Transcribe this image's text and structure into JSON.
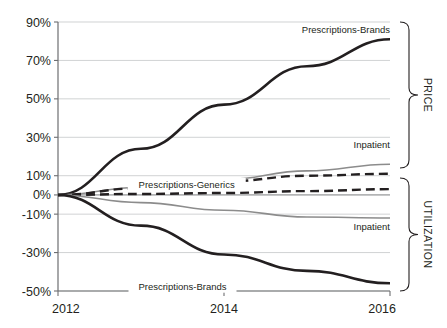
{
  "chart_data": {
    "type": "line",
    "title": "",
    "xlabel": "",
    "ylabel": "",
    "xlim": [
      2012,
      2016
    ],
    "ylim": [
      -50,
      90
    ],
    "grid": true,
    "legend_position": "inline-end-labels",
    "x": [
      2012,
      2013,
      2014,
      2015,
      2016
    ],
    "xticks": [
      "2012",
      "2014",
      "2016"
    ],
    "yticks": [
      "90%",
      "70%",
      "50%",
      "30%",
      "10%",
      "0%",
      "-10%",
      "-30%",
      "-50%"
    ],
    "ytick_values": [
      90,
      70,
      50,
      30,
      10,
      0,
      -10,
      -30,
      -50
    ],
    "groups": [
      {
        "name": "PRICE",
        "range": [
          10,
          90
        ]
      },
      {
        "name": "UTILIZATION",
        "range": [
          -50,
          0
        ]
      }
    ],
    "series": [
      {
        "name": "Prescriptions-Brands",
        "group": "PRICE",
        "style": "solid",
        "color": "#231f20",
        "width": 2.6,
        "label": "Prescriptions-Brands",
        "label_x": 2015.05,
        "label_y": 86,
        "values": [
          0,
          24,
          47,
          67,
          81
        ]
      },
      {
        "name": "Inpatient",
        "group": "PRICE",
        "style": "solid",
        "color": "#8c8c8c",
        "width": 1.6,
        "label": "Inpatient",
        "label_x": 2015.25,
        "label_y": 26,
        "values": [
          0,
          4,
          8,
          12.5,
          16
        ]
      },
      {
        "name": "Prescriptions-Generics",
        "group": "PRICE",
        "style": "dashed",
        "color": "#231f20",
        "width": 2.4,
        "label": "Prescriptions-Generics",
        "label_x": 2013.55,
        "label_y": 5.5,
        "values": [
          0,
          3.5,
          7,
          10,
          11
        ]
      },
      {
        "name": "Prescriptions-Generics-Utilization",
        "group": "UTILIZATION",
        "style": "dashed",
        "color": "#231f20",
        "width": 2.4,
        "label": "",
        "label_x": 0,
        "label_y": 0,
        "values": [
          0,
          0.5,
          1,
          2,
          3
        ]
      },
      {
        "name": "Inpatient-Utilization",
        "group": "UTILIZATION",
        "style": "solid",
        "color": "#8c8c8c",
        "width": 1.6,
        "label": "Inpatient",
        "label_x": 2015.3,
        "label_y": -16.5,
        "values": [
          0,
          -4,
          -8,
          -11.5,
          -12
        ]
      },
      {
        "name": "Prescriptions-Brands-Utilization",
        "group": "UTILIZATION",
        "style": "solid",
        "color": "#231f20",
        "width": 2.6,
        "label": "Prescriptions-Brands",
        "label_x": 2013.5,
        "label_y": -47.5,
        "values": [
          0,
          -16,
          -31,
          -39.5,
          -46
        ]
      }
    ],
    "colors": {
      "axis": "#6d6e71",
      "grid": "#bcbec0",
      "dark_series": "#231f20",
      "gray_series": "#8c8c8c",
      "text": "#231f20",
      "background": "#ffffff"
    }
  }
}
